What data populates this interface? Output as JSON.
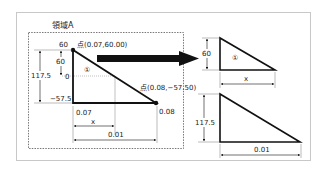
{
  "title": "領域A",
  "left_triangle": {
    "region_label": "①",
    "top_value": "60",
    "upper_height": "60",
    "zero_label": "0",
    "total_height": "117.5",
    "bottom_value": "−57.5",
    "point_top": "点(0.07,60.00)",
    "point_bottom": "点(0.08,−57.50)",
    "x_start": "0.07",
    "x_end": "0.08",
    "x_partial": "x",
    "x_width": "0.01"
  },
  "arrow": {
    "direction": "right"
  },
  "small_triangle": {
    "region_label": "①",
    "height": "60",
    "width": "x"
  },
  "large_triangle": {
    "height": "117.5",
    "width": "0.01"
  },
  "colors": {
    "line": "#111111",
    "frame": "#c8c8c8",
    "dashed": "#555555",
    "dotted": "#999999"
  }
}
